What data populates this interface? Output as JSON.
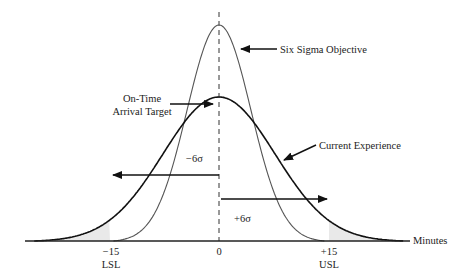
{
  "diagram": {
    "title": "",
    "axis": {
      "label": "Minutes",
      "ticks": [
        {
          "value": "−15",
          "sub": "LSL",
          "x": 110
        },
        {
          "value": "0",
          "sub": "",
          "x": 219
        },
        {
          "value": "+15",
          "sub": "USL",
          "x": 329
        }
      ]
    },
    "curves": [
      {
        "name": "Six Sigma Objective",
        "sigma_px": 32,
        "peak_px": 216,
        "stroke": "#555555",
        "width": 1.1
      },
      {
        "name": "Current Experience",
        "sigma_px": 56,
        "peak_px": 144,
        "stroke": "#111111",
        "width": 1.6
      }
    ],
    "labels": {
      "six_sigma": "Six Sigma Objective",
      "target_line1": "On-Time",
      "target_line2": "Arrival Target",
      "current": "Current Experience",
      "minus_sigma": "−6σ",
      "plus_sigma": "+6σ"
    },
    "colors": {
      "shade": "#e9e9e9",
      "axis": "#222222"
    }
  }
}
